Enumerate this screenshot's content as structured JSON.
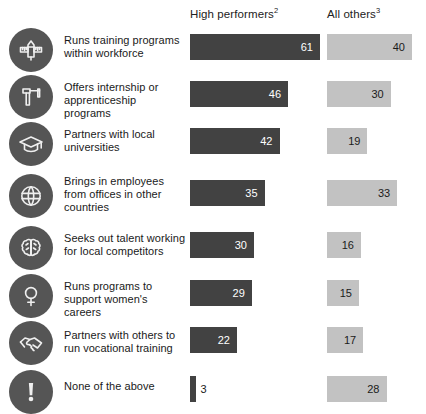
{
  "chart_data": {
    "type": "bar",
    "title": "",
    "xlabel": "",
    "ylabel": "",
    "orientation": "horizontal",
    "grid": false,
    "legend_position": "top",
    "value_unit": "% of respondents",
    "xlim": [
      0,
      61
    ],
    "categories": [
      "Runs training programs within workforce",
      "Offers internship or apprenticeship programs",
      "Partners with local universities",
      "Brings in employees from offices in other countries",
      "Seeks out talent working for local competitors",
      "Runs programs to support women's careers",
      "Partners with others to run vocational training",
      "None of the above"
    ],
    "series": [
      {
        "name": "High performers",
        "name_superscript": "2",
        "color": "#424242",
        "values": [
          61,
          46,
          42,
          35,
          30,
          29,
          22,
          3
        ]
      },
      {
        "name": "All others",
        "name_superscript": "3",
        "color": "#c2c2c2",
        "values": [
          40,
          30,
          19,
          33,
          16,
          15,
          17,
          28
        ]
      }
    ]
  },
  "header": {
    "high_performers": "High performers",
    "high_performers_sup": "2",
    "all_others": "All others",
    "all_others_sup": "3"
  },
  "rows": [
    {
      "icon": "pencil-ruler-icon",
      "label": "Runs training programs within workforce",
      "high": "61",
      "all": "40"
    },
    {
      "icon": "caliper-icon",
      "label": "Offers internship or apprenticeship programs",
      "high": "46",
      "all": "30"
    },
    {
      "icon": "graduation-cap-icon",
      "label": "Partners with local universities",
      "high": "42",
      "all": "19"
    },
    {
      "icon": "globe-icon",
      "label": "Brings in employees from offices in other countries",
      "high": "35",
      "all": "33"
    },
    {
      "icon": "brain-icon",
      "label": "Seeks out talent working for local competitors",
      "high": "30",
      "all": "16"
    },
    {
      "icon": "venus-symbol-icon",
      "label": "Runs programs to support women's careers",
      "high": "29",
      "all": "15"
    },
    {
      "icon": "handshake-icon",
      "label": "Partners with others to run vocational training",
      "high": "22",
      "all": "17"
    },
    {
      "icon": "exclamation-icon",
      "label": "None of the above",
      "high": "3",
      "all": "28"
    }
  ],
  "colors": {
    "high_performers_bar": "#424242",
    "all_others_bar": "#c2c2c2",
    "icon_disc": "#555555",
    "background": "#ffffff",
    "text": "#1a1a1a"
  }
}
